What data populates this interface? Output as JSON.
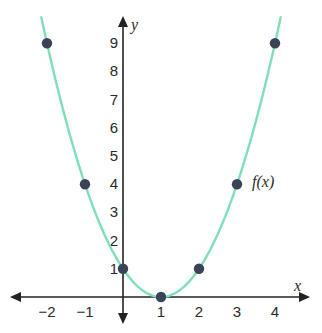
{
  "chart_data": {
    "type": "line",
    "title": "",
    "xlabel": "x",
    "ylabel": "y",
    "function_label": "f(x)",
    "function": "(x-1)^2",
    "xlim": [
      -2.6,
      4.6
    ],
    "ylim": [
      -0.8,
      10
    ],
    "x_ticks": [
      -2,
      -1,
      1,
      2,
      3,
      4
    ],
    "x_tick_labels": [
      "−2",
      "−1",
      "1",
      "2",
      "3",
      "4"
    ],
    "y_ticks": [
      1,
      2,
      3,
      4,
      5,
      6,
      7,
      8,
      9
    ],
    "y_tick_labels": [
      "1",
      "2",
      "3",
      "4",
      "5",
      "6",
      "7",
      "8",
      "9"
    ],
    "grid": false,
    "series": [
      {
        "name": "f(x)",
        "kind": "curve",
        "color": "#7fe0b8",
        "x_range": [
          -2.15,
          4.15
        ]
      },
      {
        "name": "points",
        "kind": "scatter",
        "color": "#3a4456",
        "x": [
          -2,
          -1,
          0,
          1,
          2,
          3,
          4
        ],
        "y": [
          9,
          4,
          1,
          0,
          1,
          4,
          9
        ]
      }
    ],
    "axis_color": "#222222"
  }
}
